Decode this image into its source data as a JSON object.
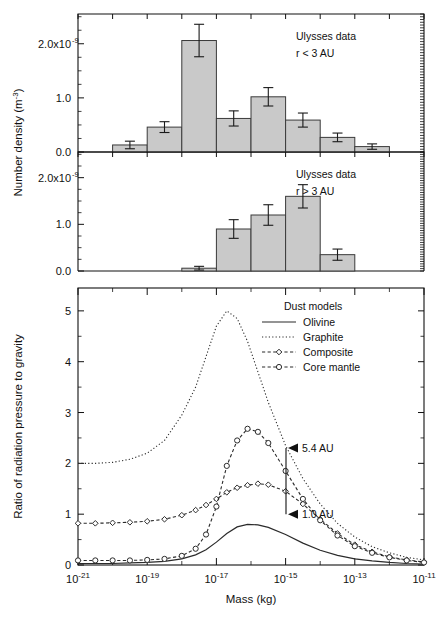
{
  "figure": {
    "width": 440,
    "height": 620,
    "background": "#ffffff",
    "bar_fill": "#c9c9c9",
    "line_color": "#2b2b2b"
  },
  "shared_axis": {
    "xlabel": "Mass (kg)",
    "x_tick_labels": [
      "10",
      "10",
      "10",
      "10",
      "10",
      "10"
    ],
    "x_tick_exponents": [
      "-21",
      "-19",
      "-17",
      "-15",
      "-13",
      "-11"
    ],
    "x_tick_values": [
      -21,
      -19,
      -17,
      -15,
      -13,
      -11
    ],
    "xlim": [
      -21,
      -11
    ],
    "ylabel_top": "Number density (m",
    "ylabel_top_sup": "-3",
    "ylabel_top_close": ")"
  },
  "caption": "Fig. 3. Number density ... of interplanetary dust ...",
  "chart_data": [
    {
      "id": "panel-top",
      "type": "bar",
      "title": "",
      "annotation_lines": [
        "Ulysses data",
        "r < 3 AU"
      ],
      "xlabel": "",
      "ylabel": "Number density (m-3)",
      "xlim": [
        -21,
        -11
      ],
      "ylim": [
        0,
        2.55
      ],
      "y_tick_values": [
        0.0,
        1.0,
        2.0
      ],
      "y_tick_labels": [
        "0.0",
        "1.0",
        "2.0x10"
      ],
      "y_tick_sup": [
        "",
        "",
        "-9"
      ],
      "y_unit_scale": "1e-9",
      "grid": false,
      "bin_edges": [
        -20.0,
        -19.0,
        -18.0,
        -17.0,
        -16.0,
        -15.0,
        -14.0,
        -13.0,
        -12.0
      ],
      "bin_centers": [
        -19.5,
        -18.5,
        -17.5,
        -16.5,
        -15.5,
        -14.5,
        -13.5,
        -12.5
      ],
      "values": [
        0.13,
        0.46,
        2.06,
        0.62,
        1.02,
        0.59,
        0.27,
        0.1
      ],
      "err_low": [
        0.07,
        0.1,
        0.3,
        0.14,
        0.17,
        0.13,
        0.08,
        0.05
      ],
      "err_high": [
        0.07,
        0.1,
        0.3,
        0.14,
        0.17,
        0.13,
        0.08,
        0.05
      ]
    },
    {
      "id": "panel-middle",
      "type": "bar",
      "title": "",
      "annotation_lines": [
        "Ulysses data",
        "r > 3 AU"
      ],
      "xlabel": "",
      "ylabel": "Number density (m-3)",
      "xlim": [
        -21,
        -11
      ],
      "ylim": [
        0,
        2.55
      ],
      "y_tick_values": [
        0.0,
        1.0,
        2.0
      ],
      "y_tick_labels": [
        "0.0",
        "1.0",
        "2.0x10"
      ],
      "y_tick_sup": [
        "",
        "",
        "-9"
      ],
      "y_unit_scale": "1e-9",
      "grid": false,
      "bin_edges": [
        -18.0,
        -17.0,
        -16.0,
        -15.0,
        -14.0,
        -13.0
      ],
      "bin_centers": [
        -17.5,
        -16.5,
        -15.5,
        -14.5,
        -13.5
      ],
      "values": [
        0.06,
        0.9,
        1.2,
        1.6,
        0.35
      ],
      "err_low": [
        0.04,
        0.2,
        0.22,
        0.25,
        0.12
      ],
      "err_high": [
        0.04,
        0.2,
        0.22,
        0.25,
        0.12
      ]
    },
    {
      "id": "panel-bottom",
      "type": "line",
      "title": "",
      "xlabel": "Mass (kg)",
      "ylabel": "Ratio of radiation pressure to gravity",
      "xlim": [
        -21,
        -11
      ],
      "ylim": [
        0,
        5.45
      ],
      "y_tick_values": [
        0,
        1,
        2,
        3,
        4,
        5
      ],
      "y_tick_labels": [
        "0",
        "1",
        "2",
        "3",
        "4",
        "5"
      ],
      "grid": false,
      "legend_title": "Dust models",
      "legend_position": "top-right",
      "annotations": [
        {
          "label": "5.4 AU",
          "value": 2.3
        },
        {
          "label": "1.0 AU",
          "value": 1.0
        }
      ],
      "x": [
        -21.0,
        -20.5,
        -20.0,
        -19.5,
        -19.0,
        -18.5,
        -18.0,
        -17.6,
        -17.3,
        -17.0,
        -16.7,
        -16.4,
        -16.1,
        -15.8,
        -15.5,
        -15.0,
        -14.5,
        -14.0,
        -13.5,
        -13.0,
        -12.5,
        -12.0,
        -11.5,
        -11.0
      ],
      "series": [
        {
          "name": "Olivine",
          "style": "solid",
          "marker": "none",
          "values": [
            0.03,
            0.03,
            0.03,
            0.04,
            0.05,
            0.07,
            0.12,
            0.2,
            0.3,
            0.45,
            0.62,
            0.75,
            0.8,
            0.79,
            0.74,
            0.6,
            0.43,
            0.29,
            0.19,
            0.12,
            0.08,
            0.05,
            0.03,
            0.02
          ]
        },
        {
          "name": "Graphite",
          "style": "dotted",
          "marker": "none",
          "values": [
            2.0,
            2.0,
            2.02,
            2.08,
            2.2,
            2.45,
            2.95,
            3.5,
            4.1,
            4.7,
            5.0,
            4.85,
            4.4,
            3.8,
            3.2,
            2.35,
            1.7,
            1.2,
            0.82,
            0.55,
            0.36,
            0.24,
            0.15,
            0.1
          ]
        },
        {
          "name": "Composite",
          "style": "dashed",
          "marker": "diamond",
          "values": [
            0.82,
            0.82,
            0.83,
            0.84,
            0.86,
            0.9,
            0.98,
            1.08,
            1.18,
            1.3,
            1.43,
            1.52,
            1.57,
            1.6,
            1.58,
            1.45,
            1.2,
            0.9,
            0.62,
            0.4,
            0.26,
            0.16,
            0.1,
            0.06
          ]
        },
        {
          "name": "Core mantle",
          "style": "dashed",
          "marker": "circle",
          "values": [
            0.09,
            0.09,
            0.09,
            0.09,
            0.1,
            0.12,
            0.18,
            0.32,
            0.6,
            1.15,
            1.95,
            2.45,
            2.68,
            2.62,
            2.4,
            1.85,
            1.3,
            0.88,
            0.58,
            0.37,
            0.24,
            0.15,
            0.09,
            0.05
          ]
        }
      ]
    }
  ],
  "legend": {
    "title": "Dust models",
    "items": [
      {
        "label": "Olivine",
        "style": "solid",
        "marker": "none"
      },
      {
        "label": "Graphite",
        "style": "dotted",
        "marker": "none"
      },
      {
        "label": "Composite",
        "style": "dashed",
        "marker": "diamond"
      },
      {
        "label": "Core mantle",
        "style": "dashed",
        "marker": "circle"
      }
    ]
  }
}
